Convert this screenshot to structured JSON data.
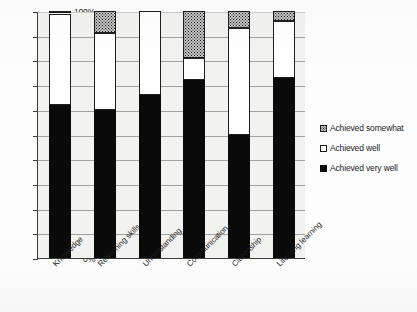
{
  "chart_data": {
    "type": "bar",
    "stacked": true,
    "stack_mode": "percent",
    "title": "",
    "subtitle": "",
    "xlabel": "",
    "ylabel": "",
    "ylim": [
      0,
      100
    ],
    "ytick_labels": [
      "100%",
      "90%",
      "80%",
      "70%",
      "60%",
      "50%",
      "40%",
      "30%",
      "20%",
      "10%",
      "0%"
    ],
    "ytick_values": [
      100,
      90,
      80,
      70,
      60,
      50,
      40,
      30,
      20,
      10,
      0
    ],
    "grid": true,
    "grid_axis": "y",
    "legend_position": "right",
    "categories": [
      "Knowledge",
      "Reasoning skills",
      "Understanding",
      "Communication",
      "Citizenship",
      "Life-long learning"
    ],
    "series": [
      {
        "name": "Achieved very well",
        "fill": "solid-black",
        "color": "#0a0a0a",
        "values": [
          62,
          60,
          66,
          72,
          50,
          73
        ]
      },
      {
        "name": "Achieved well",
        "fill": "white",
        "color": "#ffffff",
        "values": [
          37,
          31,
          34,
          9,
          43,
          23
        ]
      },
      {
        "name": "Achieved somewhat",
        "fill": "stippled-gray",
        "color": "#c9c9c9",
        "values": [
          1,
          9,
          0,
          19,
          7,
          4
        ]
      }
    ],
    "legend_order": [
      "Achieved somewhat",
      "Achieved well",
      "Achieved very well"
    ]
  },
  "legend": {
    "items": [
      {
        "label": "Achieved somewhat",
        "icon": "stippled-square-swatch"
      },
      {
        "label": "Achieved well",
        "icon": "white-square-swatch"
      },
      {
        "label": "Achieved very well",
        "icon": "black-square-swatch"
      }
    ]
  }
}
